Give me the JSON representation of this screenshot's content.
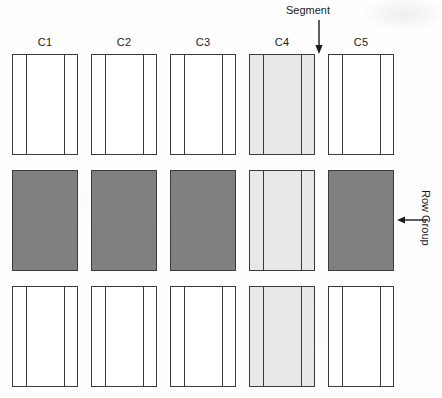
{
  "figure": {
    "background_color": "#fefefe",
    "stroke_color": "#3a3a3a",
    "fill_dark_color": "#808080",
    "fill_light_color": "#e8e8e8",
    "fill_white_color": "#ffffff"
  },
  "column_headers": [
    {
      "label": "C1"
    },
    {
      "label": "C2"
    },
    {
      "label": "C3"
    },
    {
      "label": "C4"
    },
    {
      "label": "C5"
    }
  ],
  "annotations": {
    "segment": {
      "label": "Segment",
      "arrow_direction": "down",
      "points_to": "C4 row-group 1 third segment"
    },
    "row_group": {
      "label": "Row Group",
      "arrow_direction": "left",
      "orientation": "vertical",
      "points_to": "C5 row-group 2 block"
    }
  },
  "grid": {
    "row_groups": [
      {
        "name": "row-group-1",
        "blocks": [
          {
            "column": "C1",
            "fill": "white",
            "segments": [
              "narrow",
              "wide",
              "narrow"
            ]
          },
          {
            "column": "C2",
            "fill": "white",
            "segments": [
              "narrow",
              "wide",
              "narrow"
            ]
          },
          {
            "column": "C3",
            "fill": "white",
            "segments": [
              "narrow",
              "wide",
              "narrow"
            ]
          },
          {
            "column": "C4",
            "fill": "light",
            "segments": [
              "narrow",
              "wide",
              "narrow"
            ]
          },
          {
            "column": "C5",
            "fill": "white",
            "segments": [
              "narrow",
              "wide",
              "narrow"
            ]
          }
        ]
      },
      {
        "name": "row-group-2",
        "blocks": [
          {
            "column": "C1",
            "fill": "dark",
            "segments": []
          },
          {
            "column": "C2",
            "fill": "dark",
            "segments": []
          },
          {
            "column": "C3",
            "fill": "dark",
            "segments": []
          },
          {
            "column": "C4",
            "fill": "light",
            "segments": [
              "narrow",
              "wide",
              "narrow"
            ]
          },
          {
            "column": "C5",
            "fill": "dark",
            "segments": []
          }
        ]
      },
      {
        "name": "row-group-3",
        "blocks": [
          {
            "column": "C1",
            "fill": "white",
            "segments": [
              "narrow",
              "wide",
              "narrow"
            ]
          },
          {
            "column": "C2",
            "fill": "white",
            "segments": [
              "narrow",
              "wide",
              "narrow"
            ]
          },
          {
            "column": "C3",
            "fill": "white",
            "segments": [
              "narrow",
              "wide",
              "narrow"
            ]
          },
          {
            "column": "C4",
            "fill": "light",
            "segments": [
              "narrow",
              "wide",
              "narrow"
            ]
          },
          {
            "column": "C5",
            "fill": "white",
            "segments": [
              "narrow",
              "wide",
              "narrow"
            ]
          }
        ]
      }
    ]
  },
  "layout": {
    "column_x": [
      12,
      91,
      170,
      249,
      328
    ],
    "block_width": 66,
    "row_y": [
      54,
      170,
      286
    ],
    "block_height": 101,
    "label_y": 36
  }
}
